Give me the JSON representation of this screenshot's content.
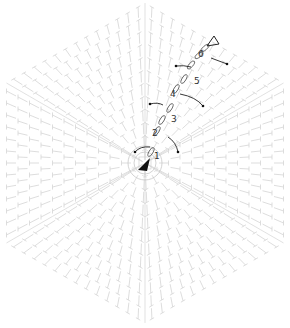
{
  "diagram": {
    "type": "crochet-chart",
    "shape": "hexagon",
    "rounds": 13,
    "center": {
      "x": 145,
      "y": 163
    },
    "colors": {
      "stitch": "#d4d4d4",
      "highlight": "#222222",
      "background": "#ffffff"
    },
    "row_labels": [
      {
        "label": "1",
        "x": 155,
        "y": 159
      },
      {
        "label": "2",
        "x": 154,
        "y": 135
      },
      {
        "label": "3",
        "x": 173,
        "y": 121
      },
      {
        "label": "4",
        "x": 173,
        "y": 96
      },
      {
        "label": "5",
        "x": 196,
        "y": 83
      },
      {
        "label": "6",
        "x": 199,
        "y": 56
      }
    ],
    "symbols": {
      "start": "filled-triangle-icon",
      "end": "open-triangle-icon"
    }
  }
}
